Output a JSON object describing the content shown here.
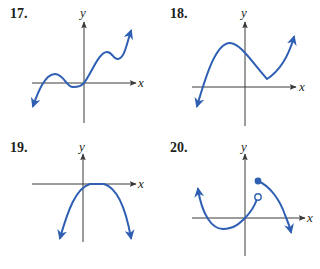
{
  "problems": [
    {
      "number": "17.",
      "x_label": "x",
      "y_label": "y",
      "description": "Wavy curve from lower-left, small hump above x-axis, dip below, through origin, hump and dip, rising to upper right"
    },
    {
      "number": "18.",
      "x_label": "x",
      "y_label": "y",
      "description": "Curve rising from lower-left to a maximum, descending to a sharp corner above x-axis, then rising to upper right"
    },
    {
      "number": "19.",
      "x_label": "x",
      "y_label": "y",
      "description": "Downward-opening parabola-like curve with vertex touching x-axis right of origin"
    },
    {
      "number": "20.",
      "x_label": "x",
      "y_label": "y",
      "description": "Piecewise curve: U-shaped branch through origin ending at open circle; second branch starting at filled dot and descending through x-axis"
    }
  ],
  "colors": {
    "curve": "#2f5fb3",
    "axis": "#3a3a3a",
    "text": "#231f20"
  }
}
